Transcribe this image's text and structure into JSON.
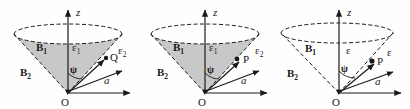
{
  "figure": {
    "background_color": "#fefefe",
    "stroke_color": "#1a1a1a",
    "fill_color": "#c8c8c8",
    "panel_count": 3
  },
  "panels": [
    {
      "id": "panel-a",
      "name": "cone-diagram-left",
      "filled": true,
      "cone_edges_style": "dashed",
      "labels": {
        "z_axis": "z",
        "origin": "O",
        "radial_axis": "a",
        "region_inner": "B",
        "region_inner_sub": "1",
        "region_outer": "B",
        "region_outer_sub": "2",
        "eps_inner": "ε",
        "eps_inner_sub": "1",
        "eps_outer": "ε",
        "eps_outer_sub": "2",
        "angle": "ψ",
        "point": "Q"
      }
    },
    {
      "id": "panel-b",
      "name": "cone-diagram-middle",
      "filled": true,
      "cone_edges_style": "dashed",
      "labels": {
        "z_axis": "z",
        "origin": "O",
        "radial_axis": "a",
        "region_inner": "B",
        "region_inner_sub": "1",
        "region_outer": "B",
        "region_outer_sub": "2",
        "eps_inner": "ε",
        "eps_inner_sub": "1",
        "eps_outer": "ε",
        "eps_outer_sub": "2",
        "angle": "ψ",
        "point": "P"
      }
    },
    {
      "id": "panel-c",
      "name": "cone-diagram-right",
      "filled": false,
      "cone_edges_style": "dashed",
      "labels": {
        "z_axis": "z",
        "origin": "O",
        "radial_axis": "a",
        "region_inner": "B",
        "region_inner_sub": "1",
        "region_outer": "B",
        "region_outer_sub": "2",
        "eps_inner": "ε",
        "eps_inner_sub": "",
        "eps_outer": "ε",
        "eps_outer_sub": "",
        "angle": "ψ",
        "point": "P"
      }
    }
  ]
}
